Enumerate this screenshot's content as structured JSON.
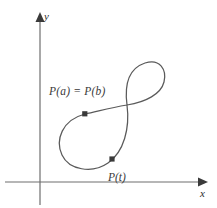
{
  "figure": {
    "kind": "parametric-curve-diagram",
    "background_color": "#ffffff",
    "curve_color": "#5a5a5a",
    "axis_color": "#6e6e6e",
    "marker_color": "#3a3a3a",
    "text_color": "#3a3a3a",
    "corner_mark": ""
  },
  "axes": {
    "x_label": "x",
    "y_label": "y",
    "origin": {
      "x": 40,
      "y": 182
    },
    "x_axis": {
      "start_x": 5,
      "end_x": 205,
      "y": 182,
      "arrow": "right"
    },
    "y_axis": {
      "x": 40,
      "start_y": 205,
      "end_y": 14,
      "arrow": "up"
    }
  },
  "curve": {
    "description": "closed figure-eight curve with self-intersection",
    "self_intersection": {
      "x": 127,
      "y": 105
    },
    "path": "M 85 114 C 62 120 55 140 62 155 C 69 170 92 174 108 163 C 124 152 130 128 127 105 C 124 82 130 68 145 63 C 160 58 167 70 164 82 C 161 94 146 102 127 105 C 108 108 96 112 85 114 Z"
  },
  "points": [
    {
      "id": "p-a-b",
      "label": "P(a) = P(b)",
      "marker": {
        "x": 85,
        "y": 114
      },
      "label_position": {
        "x": 49,
        "y": 86
      }
    },
    {
      "id": "p-t",
      "label": "P(t)",
      "marker": {
        "x": 112,
        "y": 159
      },
      "label_position": {
        "x": 108,
        "y": 172
      }
    }
  ]
}
